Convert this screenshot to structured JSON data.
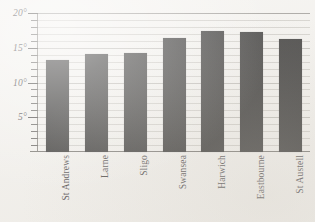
{
  "chart_data": {
    "type": "bar",
    "title": "",
    "xlabel": "",
    "ylabel": "",
    "categories": [
      "St Andrews",
      "Larne",
      "Sligo",
      "Swansea",
      "Harwich",
      "Eastbourne",
      "St Austell"
    ],
    "values": [
      13.3,
      14.1,
      14.3,
      16.4,
      17.4,
      17.2,
      16.3
    ],
    "ylim": [
      0,
      20
    ],
    "y_ticks_major": [
      5,
      10,
      15,
      20
    ],
    "y_tick_labels": [
      "5°",
      "10°",
      "15°",
      "20°"
    ],
    "y_minor_tick_step": 1,
    "grid": true,
    "grid_orientation": "horizontal",
    "legend": "none",
    "bar_color": "#0d0c0b",
    "background_color": "#f2f0ec",
    "axis_color": "#5d5a55",
    "gridline_color": "#c9c6c0"
  },
  "axis": {
    "y_label_0": "20°",
    "y_label_1": "15°",
    "y_label_2": "10°",
    "y_label_3": "5°"
  },
  "x_axis": {
    "labels": [
      "St Andrews",
      "Larne",
      "Sligo",
      "Swansea",
      "Harwich",
      "Eastbourne",
      "St Austell"
    ]
  }
}
